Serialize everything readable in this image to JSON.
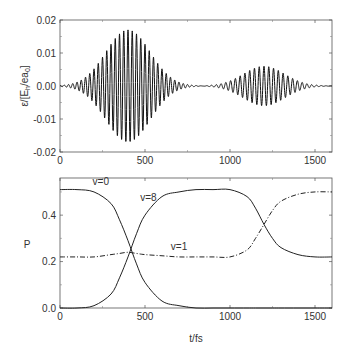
{
  "chart_data": [
    {
      "type": "line",
      "title": "",
      "xlabel": "",
      "ylabel": "ε/[E_h/ea_0]",
      "xlim": [
        0,
        1600
      ],
      "ylim": [
        -0.02,
        0.02
      ],
      "xticks": [
        "0",
        "500",
        "1000",
        "1500"
      ],
      "yticks": [
        "0.02",
        "0.01",
        "0.00",
        "-0.01",
        "-0.02"
      ],
      "grid": false,
      "legend": null,
      "series": [
        {
          "name": "field",
          "description": "Two Gaussian-envelope oscillating pulses",
          "pulses": [
            {
              "center": 400,
              "peak_amplitude": 0.017,
              "approx_start": 0,
              "approx_end": 780,
              "cycles": 24
            },
            {
              "center": 1200,
              "peak_amplitude": 0.006,
              "approx_start": 830,
              "approx_end": 1560,
              "cycles": 20
            }
          ]
        }
      ]
    },
    {
      "type": "line",
      "title": "",
      "xlabel": "t/fs",
      "ylabel": "P",
      "xlim": [
        0,
        1600
      ],
      "ylim": [
        0,
        0.56
      ],
      "xticks": [
        "0",
        "500",
        "1000",
        "1500"
      ],
      "yticks": [
        "0.0",
        "0.2",
        "0.4"
      ],
      "grid": false,
      "legend": null,
      "annotations": [
        {
          "text": "v=0",
          "x": 240,
          "y": 0.53
        },
        {
          "text": "v=8",
          "x": 520,
          "y": 0.46
        },
        {
          "text": "v=1",
          "x": 700,
          "y": 0.25
        }
      ],
      "x": [
        0,
        100,
        200,
        300,
        350,
        400,
        450,
        500,
        600,
        700,
        800,
        900,
        1000,
        1100,
        1150,
        1200,
        1250,
        1300,
        1400,
        1500,
        1600
      ],
      "series": [
        {
          "name": "v=0",
          "style": "solid",
          "values": [
            0.51,
            0.51,
            0.5,
            0.45,
            0.38,
            0.29,
            0.19,
            0.11,
            0.03,
            0.01,
            0.0,
            0.0,
            0.0,
            0.0,
            0.0,
            0.0,
            0.0,
            0.0,
            0.0,
            0.0,
            0.0
          ]
        },
        {
          "name": "v=8",
          "style": "solid",
          "values": [
            0.0,
            0.0,
            0.01,
            0.06,
            0.13,
            0.22,
            0.32,
            0.4,
            0.48,
            0.5,
            0.51,
            0.51,
            0.51,
            0.48,
            0.43,
            0.36,
            0.3,
            0.26,
            0.23,
            0.22,
            0.22
          ]
        },
        {
          "name": "v=1",
          "style": "dash-dot",
          "values": [
            0.22,
            0.22,
            0.22,
            0.23,
            0.235,
            0.24,
            0.235,
            0.23,
            0.225,
            0.22,
            0.22,
            0.22,
            0.22,
            0.25,
            0.3,
            0.36,
            0.42,
            0.46,
            0.49,
            0.5,
            0.5
          ]
        }
      ]
    }
  ]
}
